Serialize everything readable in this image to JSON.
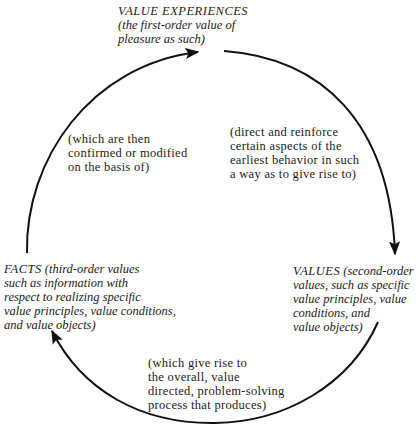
{
  "diagram": {
    "type": "cycle",
    "direction": "clockwise",
    "nodes": {
      "value_experiences": {
        "title": "VALUE EXPERIENCES",
        "lines": [
          "(the first-order value of",
          "pleasure as such)"
        ]
      },
      "values": {
        "title": "VALUES",
        "lines": [
          "(second-order",
          "values, such as specific",
          "value principles, value",
          "conditions, and",
          "value objects)"
        ]
      },
      "facts": {
        "title": "FACTS",
        "lines": [
          "(third-order values",
          "such as information with",
          "respect to realizing specific",
          "value principles, value conditions,",
          "and value objects)"
        ]
      }
    },
    "edges": {
      "experiences_to_values": {
        "lines": [
          "(direct and reinforce",
          "certain aspects of the",
          "earliest behavior in such",
          "a way as to give rise to)"
        ]
      },
      "values_to_facts": {
        "lines": [
          "(which give rise to",
          "the overall, value",
          "directed, problem-solving",
          "process that produces)"
        ]
      },
      "facts_to_experiences": {
        "lines": [
          "(which are then",
          "confirmed or modified",
          "on the basis of)"
        ]
      }
    },
    "colors": {
      "stroke": "#111111",
      "text": "#1a1a1a",
      "background": "#ffffff"
    }
  }
}
